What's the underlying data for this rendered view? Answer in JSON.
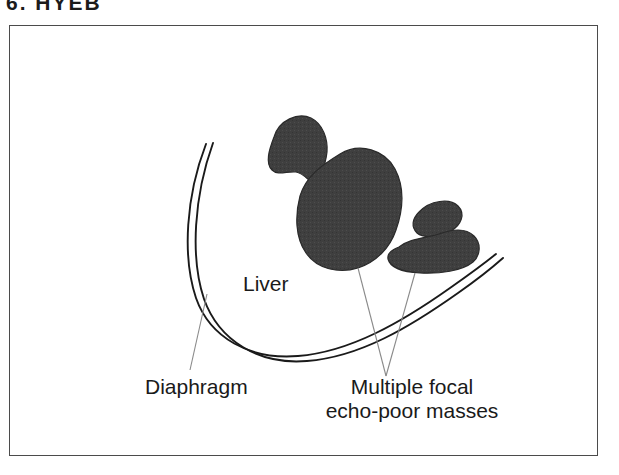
{
  "figure": {
    "caption": "6.  HYEB",
    "frame": {
      "border_color": "#4b4b4b",
      "background": "#ffffff"
    }
  },
  "diagram": {
    "type": "medical-illustration",
    "mass_fill_color": "#3f3f3f",
    "mass_edge_color": "#2a2a2a",
    "outline_color": "#1a1a1a",
    "leader_line_color": "#7a7a7a",
    "labels": [
      {
        "id": "liver",
        "text": "Liver",
        "x": 233,
        "y": 265,
        "anchor": "start"
      },
      {
        "id": "diaphragm",
        "text": "Diaphragm",
        "x": 135,
        "y": 368,
        "anchor": "start"
      },
      {
        "id": "masses-line-1",
        "text": "Multiple focal",
        "x": 402,
        "y": 368,
        "anchor": "middle"
      },
      {
        "id": "masses-line-2",
        "text": "echo-poor masses",
        "x": 402,
        "y": 392,
        "anchor": "middle"
      }
    ],
    "structures": [
      {
        "id": "diaphragm-curve",
        "name": "Diaphragm",
        "style": "double-line-curve"
      },
      {
        "id": "mass-superior",
        "name": "Focal echo-poor mass (superior)"
      },
      {
        "id": "mass-central",
        "name": "Focal echo-poor mass (central, largest)"
      },
      {
        "id": "mass-right-small",
        "name": "Focal echo-poor mass (right, small)"
      },
      {
        "id": "mass-right-lower",
        "name": "Focal echo-poor mass (right, lower)"
      }
    ],
    "leader_lines": [
      {
        "id": "leader-diaphragm",
        "from": "diaphragm-label",
        "to": "diaphragm-curve"
      },
      {
        "id": "leader-mass-central",
        "from": "masses-label",
        "to": "mass-central"
      },
      {
        "id": "leader-mass-right",
        "from": "masses-label",
        "to": "mass-right-lower"
      }
    ]
  }
}
